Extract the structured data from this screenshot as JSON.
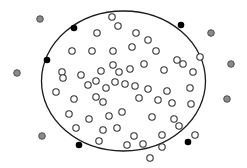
{
  "diagram": {
    "width": 247,
    "height": 168,
    "background": "#ffffff",
    "ellipse": {
      "cx": 123.5,
      "cy": 81,
      "rx": 82,
      "ry": 70,
      "stroke": "#1a1a1a",
      "stroke_width": 1.3
    },
    "boundary_points": {
      "fill": "#000000",
      "radius": 3.3,
      "points": [
        [
          74,
          28
        ],
        [
          47,
          60
        ],
        [
          181,
          25
        ],
        [
          79,
          145
        ],
        [
          188,
          142
        ]
      ]
    },
    "inner_points": {
      "fill": "#ffffff",
      "stroke": "#333333",
      "radius": 3.2,
      "points": [
        [
          112,
          17
        ],
        [
          136,
          33
        ],
        [
          97,
          33
        ],
        [
          118,
          26
        ],
        [
          148,
          40
        ],
        [
          200,
          57
        ],
        [
          193,
          72
        ],
        [
          190,
          88
        ],
        [
          72,
          51
        ],
        [
          92,
          51
        ],
        [
          113,
          51
        ],
        [
          132,
          47
        ],
        [
          156,
          51
        ],
        [
          177,
          60
        ],
        [
          62,
          72
        ],
        [
          81,
          75
        ],
        [
          101,
          71
        ],
        [
          113,
          65
        ],
        [
          119,
          72
        ],
        [
          130,
          69
        ],
        [
          144,
          64
        ],
        [
          164,
          70
        ],
        [
          183,
          64
        ],
        [
          63,
          78
        ],
        [
          88,
          85
        ],
        [
          96,
          81
        ],
        [
          106,
          88
        ],
        [
          115,
          82
        ],
        [
          125,
          84
        ],
        [
          135,
          86
        ],
        [
          148,
          89
        ],
        [
          167,
          91
        ],
        [
          56,
          92
        ],
        [
          74,
          99
        ],
        [
          96,
          97
        ],
        [
          103,
          102
        ],
        [
          139,
          98
        ],
        [
          158,
          100
        ],
        [
          172,
          103
        ],
        [
          191,
          104
        ],
        [
          69,
          114
        ],
        [
          89,
          119
        ],
        [
          109,
          116
        ],
        [
          122,
          112
        ],
        [
          152,
          117
        ],
        [
          174,
          119
        ],
        [
          76,
          128
        ],
        [
          103,
          130
        ],
        [
          117,
          128
        ],
        [
          134,
          136
        ],
        [
          162,
          135
        ],
        [
          179,
          126
        ],
        [
          99,
          141
        ],
        [
          127,
          145
        ],
        [
          143,
          144
        ],
        [
          162,
          147
        ],
        [
          150,
          158
        ],
        [
          195,
          135
        ]
      ]
    },
    "outer_points": {
      "fill": "#8a8a8a",
      "stroke": "#444444",
      "radius": 3.3,
      "points": [
        [
          40,
          19
        ],
        [
          17,
          73
        ],
        [
          42,
          136
        ],
        [
          211,
          33
        ],
        [
          231,
          64
        ],
        [
          227,
          99
        ]
      ]
    }
  }
}
